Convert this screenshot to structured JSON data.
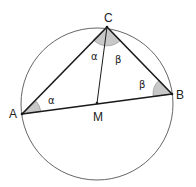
{
  "diagram": {
    "title": "",
    "circle": {
      "cx": 97,
      "cy": 104,
      "r": 76,
      "stroke": "#666666"
    },
    "points": {
      "A": {
        "label": "A",
        "x": 22,
        "y": 114
      },
      "B": {
        "label": "B",
        "x": 172,
        "y": 94
      },
      "C": {
        "label": "C",
        "x": 107,
        "y": 27
      },
      "M": {
        "label": "M",
        "x": 97,
        "y": 103
      }
    },
    "angles": {
      "at_A": {
        "label": "α"
      },
      "at_B": {
        "label": "β"
      },
      "at_C_left": {
        "label": "α"
      },
      "at_C_right": {
        "label": "β"
      }
    },
    "colors": {
      "line": "#1a1a1a",
      "circle": "#666666",
      "angle_fill": "#c8c8c8",
      "angle_stroke": "#888888",
      "text": "#222222"
    }
  }
}
